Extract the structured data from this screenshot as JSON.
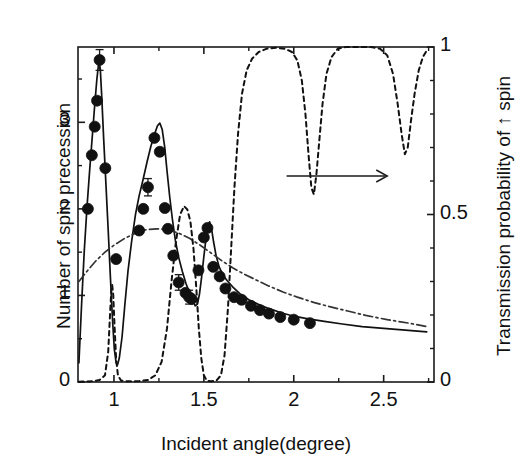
{
  "figure": {
    "name": "spin-precession-transmission-plot",
    "background": "#ffffff",
    "ink_color": "#1a1a1a"
  },
  "chart_data": {
    "type": "line",
    "title": "",
    "xlabel": "Incident angle(degree)",
    "ylabel": "Number of spin precession",
    "y2label": "Transmission probability of ↑ spin",
    "xlim": [
      0.8,
      2.78
    ],
    "ylim": [
      0,
      3.87
    ],
    "y2lim": [
      0,
      1
    ],
    "grid": false,
    "legend": "none",
    "xticks": [
      1,
      1.5,
      2,
      2.5
    ],
    "xticklabels": [
      "1",
      "1.5",
      "2",
      "2.5"
    ],
    "x_minor_ticks": [
      1.25,
      1.75,
      2.25,
      2.75
    ],
    "yticks": [
      0,
      1,
      2,
      3
    ],
    "yticklabels": [
      "0",
      "1",
      "2",
      "3"
    ],
    "y_minor_ticks": [
      0.5,
      1.5,
      2.5,
      3.5
    ],
    "y2ticks": [
      0,
      0.5,
      1
    ],
    "y2ticklabels": [
      "0",
      "0.5",
      "1"
    ],
    "y2_minor_ticks": [
      0.1,
      0.2,
      0.3,
      0.4,
      0.6,
      0.7,
      0.8,
      0.9
    ],
    "annotations": [
      {
        "name": "right-axis-arrow",
        "type": "arrow",
        "text": "",
        "x_start": 1.96,
        "x_end": 2.52,
        "y2": 0.615,
        "direction": "right"
      }
    ],
    "series": [
      {
        "name": "Number of spin precession (measured)",
        "type": "scatter",
        "axis": "left",
        "marker": "filled-circle",
        "marker_size": 11,
        "color": "#111111",
        "points": [
          [
            0.855,
            2.0
          ],
          [
            0.877,
            2.62
          ],
          [
            0.893,
            2.95
          ],
          [
            0.906,
            3.25
          ],
          [
            0.92,
            3.72
          ],
          [
            0.952,
            2.47
          ],
          [
            1.012,
            1.42
          ],
          [
            1.14,
            1.75
          ],
          [
            1.163,
            2.0
          ],
          [
            1.189,
            2.25
          ],
          [
            1.225,
            2.82
          ],
          [
            1.255,
            2.66
          ],
          [
            1.283,
            2.01
          ],
          [
            1.3,
            1.77
          ],
          [
            1.33,
            1.46
          ],
          [
            1.36,
            1.15
          ],
          [
            1.398,
            1.03
          ],
          [
            1.418,
            0.98
          ],
          [
            1.432,
            0.96
          ],
          [
            1.47,
            1.29
          ],
          [
            1.5,
            1.67
          ],
          [
            1.52,
            1.78
          ],
          [
            1.552,
            1.33
          ],
          [
            1.588,
            1.22
          ],
          [
            1.62,
            1.08
          ],
          [
            1.668,
            0.98
          ],
          [
            1.71,
            0.95
          ],
          [
            1.762,
            0.88
          ],
          [
            1.812,
            0.83
          ],
          [
            1.862,
            0.79
          ],
          [
            1.925,
            0.75
          ],
          [
            2.0,
            0.72
          ],
          [
            2.09,
            0.68
          ]
        ]
      },
      {
        "name": "Number of spin precession (theory, solid)",
        "type": "line",
        "style": "solid",
        "axis": "left",
        "color": "#111111",
        "points": [
          [
            0.805,
            0.22
          ],
          [
            0.82,
            0.9
          ],
          [
            0.835,
            1.52
          ],
          [
            0.85,
            2.02
          ],
          [
            0.865,
            2.45
          ],
          [
            0.88,
            2.85
          ],
          [
            0.893,
            3.2
          ],
          [
            0.905,
            3.5
          ],
          [
            0.916,
            3.7
          ],
          [
            0.924,
            3.62
          ],
          [
            0.932,
            3.3
          ],
          [
            0.943,
            2.8
          ],
          [
            0.955,
            2.3
          ],
          [
            0.968,
            1.75
          ],
          [
            0.98,
            1.22
          ],
          [
            0.992,
            0.72
          ],
          [
            1.002,
            0.38
          ],
          [
            1.012,
            0.22
          ],
          [
            1.02,
            0.2
          ],
          [
            1.03,
            0.28
          ],
          [
            1.045,
            0.52
          ],
          [
            1.06,
            0.88
          ],
          [
            1.078,
            1.28
          ],
          [
            1.098,
            1.62
          ],
          [
            1.12,
            1.94
          ],
          [
            1.14,
            2.15
          ],
          [
            1.162,
            2.34
          ],
          [
            1.185,
            2.55
          ],
          [
            1.205,
            2.72
          ],
          [
            1.225,
            2.86
          ],
          [
            1.242,
            2.96
          ],
          [
            1.255,
            2.99
          ],
          [
            1.268,
            2.92
          ],
          [
            1.282,
            2.72
          ],
          [
            1.296,
            2.42
          ],
          [
            1.31,
            2.14
          ],
          [
            1.325,
            1.88
          ],
          [
            1.342,
            1.63
          ],
          [
            1.36,
            1.44
          ],
          [
            1.38,
            1.28
          ],
          [
            1.4,
            1.14
          ],
          [
            1.42,
            1.03
          ],
          [
            1.438,
            0.94
          ],
          [
            1.452,
            0.88
          ],
          [
            1.464,
            0.9
          ],
          [
            1.476,
            1.02
          ],
          [
            1.488,
            1.22
          ],
          [
            1.5,
            1.45
          ],
          [
            1.512,
            1.66
          ],
          [
            1.522,
            1.8
          ],
          [
            1.532,
            1.85
          ],
          [
            1.542,
            1.78
          ],
          [
            1.554,
            1.62
          ],
          [
            1.568,
            1.46
          ],
          [
            1.585,
            1.33
          ],
          [
            1.605,
            1.24
          ],
          [
            1.63,
            1.17
          ],
          [
            1.66,
            1.1
          ],
          [
            1.7,
            1.02
          ],
          [
            1.75,
            0.95
          ],
          [
            1.8,
            0.9
          ],
          [
            1.86,
            0.85
          ],
          [
            1.93,
            0.8
          ],
          [
            2.0,
            0.76
          ],
          [
            2.08,
            0.73
          ],
          [
            2.17,
            0.7
          ],
          [
            2.27,
            0.67
          ],
          [
            2.38,
            0.64
          ],
          [
            2.5,
            0.62
          ],
          [
            2.62,
            0.6
          ],
          [
            2.74,
            0.58
          ]
        ]
      },
      {
        "name": "Smooth envelope (dash-dot)",
        "type": "line",
        "style": "dashdot",
        "axis": "left",
        "color": "#333333",
        "points": [
          [
            0.805,
            1.16
          ],
          [
            0.85,
            1.28
          ],
          [
            0.9,
            1.4
          ],
          [
            0.95,
            1.5
          ],
          [
            1.0,
            1.58
          ],
          [
            1.06,
            1.66
          ],
          [
            1.12,
            1.72
          ],
          [
            1.18,
            1.76
          ],
          [
            1.24,
            1.77
          ],
          [
            1.3,
            1.76
          ],
          [
            1.36,
            1.72
          ],
          [
            1.42,
            1.66
          ],
          [
            1.48,
            1.58
          ],
          [
            1.54,
            1.49
          ],
          [
            1.6,
            1.4
          ],
          [
            1.66,
            1.32
          ],
          [
            1.72,
            1.25
          ],
          [
            1.79,
            1.18
          ],
          [
            1.86,
            1.11
          ],
          [
            1.94,
            1.04
          ],
          [
            2.02,
            0.98
          ],
          [
            2.11,
            0.92
          ],
          [
            2.2,
            0.87
          ],
          [
            2.3,
            0.82
          ],
          [
            2.4,
            0.77
          ],
          [
            2.52,
            0.72
          ],
          [
            2.64,
            0.68
          ],
          [
            2.74,
            0.64
          ]
        ]
      },
      {
        "name": "Transmission probability of ↑ spin (dashed)",
        "type": "line",
        "style": "dashed",
        "axis": "right",
        "color": "#111111",
        "points": [
          [
            0.805,
            0.001
          ],
          [
            0.88,
            0.002
          ],
          [
            0.92,
            0.006
          ],
          [
            0.95,
            0.02
          ],
          [
            0.968,
            0.09
          ],
          [
            0.978,
            0.2
          ],
          [
            0.985,
            0.27
          ],
          [
            0.99,
            0.29
          ],
          [
            0.996,
            0.26
          ],
          [
            1.003,
            0.17
          ],
          [
            1.012,
            0.07
          ],
          [
            1.022,
            0.02
          ],
          [
            1.04,
            0.004
          ],
          [
            1.08,
            0.002
          ],
          [
            1.14,
            0.003
          ],
          [
            1.19,
            0.006
          ],
          [
            1.23,
            0.02
          ],
          [
            1.265,
            0.06
          ],
          [
            1.295,
            0.16
          ],
          [
            1.32,
            0.3
          ],
          [
            1.345,
            0.42
          ],
          [
            1.368,
            0.5
          ],
          [
            1.39,
            0.525
          ],
          [
            1.408,
            0.515
          ],
          [
            1.425,
            0.48
          ],
          [
            1.442,
            0.4
          ],
          [
            1.458,
            0.28
          ],
          [
            1.472,
            0.16
          ],
          [
            1.486,
            0.07
          ],
          [
            1.5,
            0.02
          ],
          [
            1.516,
            0.004
          ],
          [
            1.54,
            0.002
          ],
          [
            1.57,
            0.004
          ],
          [
            1.595,
            0.02
          ],
          [
            1.615,
            0.08
          ],
          [
            1.634,
            0.22
          ],
          [
            1.652,
            0.4
          ],
          [
            1.67,
            0.58
          ],
          [
            1.69,
            0.74
          ],
          [
            1.712,
            0.86
          ],
          [
            1.738,
            0.93
          ],
          [
            1.768,
            0.965
          ],
          [
            1.805,
            0.985
          ],
          [
            1.85,
            0.995
          ],
          [
            1.9,
            0.998
          ],
          [
            1.95,
            0.995
          ],
          [
            1.99,
            0.985
          ],
          [
            2.02,
            0.96
          ],
          [
            2.045,
            0.9
          ],
          [
            2.065,
            0.8
          ],
          [
            2.082,
            0.68
          ],
          [
            2.098,
            0.58
          ],
          [
            2.112,
            0.56
          ],
          [
            2.126,
            0.62
          ],
          [
            2.142,
            0.72
          ],
          [
            2.16,
            0.83
          ],
          [
            2.182,
            0.92
          ],
          [
            2.21,
            0.97
          ],
          [
            2.245,
            0.995
          ],
          [
            2.29,
            1.0
          ],
          [
            2.36,
            1.0
          ],
          [
            2.43,
            1.0
          ],
          [
            2.48,
            0.995
          ],
          [
            2.52,
            0.975
          ],
          [
            2.552,
            0.92
          ],
          [
            2.578,
            0.83
          ],
          [
            2.6,
            0.74
          ],
          [
            2.618,
            0.68
          ],
          [
            2.634,
            0.7
          ],
          [
            2.652,
            0.78
          ],
          [
            2.672,
            0.86
          ],
          [
            2.695,
            0.93
          ],
          [
            2.718,
            0.97
          ],
          [
            2.74,
            0.99
          ]
        ]
      }
    ],
    "error_bars": [
      {
        "x": 0.92,
        "y": 3.72,
        "err": 0.12
      },
      {
        "x": 1.189,
        "y": 2.25,
        "err": 0.1
      },
      {
        "x": 1.36,
        "y": 1.15,
        "err": 0.09
      },
      {
        "x": 1.418,
        "y": 0.98,
        "err": 0.08
      }
    ]
  }
}
